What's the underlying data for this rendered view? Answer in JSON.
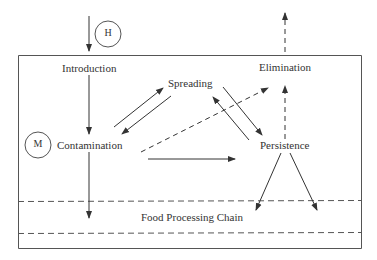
{
  "diagram": {
    "nodes": {
      "introduction": "Introduction",
      "spreading": "Spreading",
      "elimination": "Elimination",
      "contamination": "Contamination",
      "persistence": "Persistence",
      "food_processing_chain": "Food Processing Chain"
    },
    "markers": {
      "h": "H",
      "m": "M"
    },
    "edges": [
      {
        "from": "outside",
        "to": "introduction",
        "style": "solid"
      },
      {
        "from": "introduction",
        "to": "contamination",
        "style": "solid"
      },
      {
        "from": "contamination",
        "to": "food_processing_chain",
        "style": "solid"
      },
      {
        "from": "contamination",
        "to": "spreading",
        "style": "solid"
      },
      {
        "from": "spreading",
        "to": "contamination",
        "style": "solid"
      },
      {
        "from": "spreading",
        "to": "persistence",
        "style": "solid"
      },
      {
        "from": "persistence",
        "to": "spreading",
        "style": "solid"
      },
      {
        "from": "contamination",
        "to": "persistence",
        "style": "solid"
      },
      {
        "from": "contamination",
        "to": "elimination",
        "style": "dashed"
      },
      {
        "from": "persistence",
        "to": "elimination",
        "style": "dashed"
      },
      {
        "from": "elimination",
        "to": "outside",
        "style": "dashed"
      },
      {
        "from": "persistence",
        "to": "food_processing_chain",
        "style": "solid"
      },
      {
        "from": "persistence",
        "to": "food_processing_chain",
        "style": "solid"
      }
    ],
    "colors": {
      "line": "#444444",
      "text": "#333333",
      "background": "#ffffff"
    }
  }
}
